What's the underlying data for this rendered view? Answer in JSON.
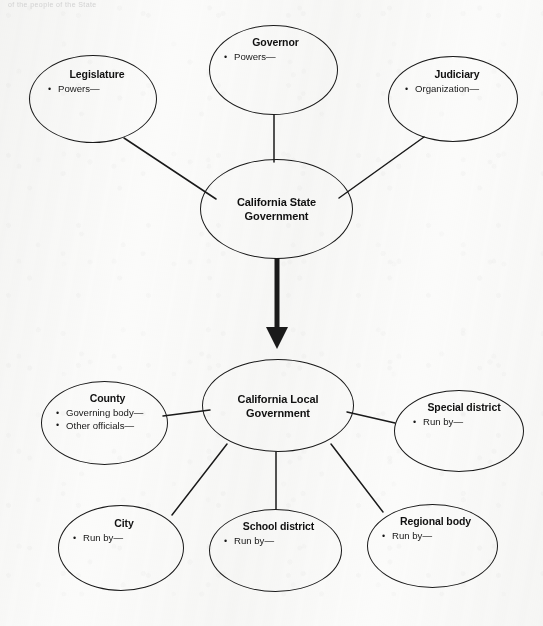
{
  "page": {
    "top_fragment": "of the people of the State",
    "background_color": "#fbfbfa",
    "ink_color": "#1a1a1a"
  },
  "diagram": {
    "type": "hierarchy-cluster",
    "hubs": [
      {
        "id": "state",
        "title": "California State Government"
      },
      {
        "id": "local",
        "title": "California Local Government"
      }
    ],
    "nodes": [
      {
        "id": "legislature",
        "title": "Legislature",
        "bullets": [
          "Powers—"
        ]
      },
      {
        "id": "governor",
        "title": "Governor",
        "bullets": [
          "Powers—"
        ]
      },
      {
        "id": "judiciary",
        "title": "Judiciary",
        "bullets": [
          "Organization—"
        ]
      },
      {
        "id": "county",
        "title": "County",
        "bullets": [
          "Governing body—",
          "Other officials—"
        ]
      },
      {
        "id": "special-district",
        "title": "Special district",
        "bullets": [
          "Run by—"
        ]
      },
      {
        "id": "city",
        "title": "City",
        "bullets": [
          "Run by—"
        ]
      },
      {
        "id": "school-district",
        "title": "School district",
        "bullets": [
          "Run by—"
        ]
      },
      {
        "id": "regional-body",
        "title": "Regional body",
        "bullets": [
          "Run by—"
        ]
      }
    ],
    "connections": [
      {
        "from": "legislature",
        "to": "state",
        "style": "line"
      },
      {
        "from": "governor",
        "to": "state",
        "style": "line"
      },
      {
        "from": "judiciary",
        "to": "state",
        "style": "line"
      },
      {
        "from": "state",
        "to": "local",
        "style": "thick-arrow-down"
      },
      {
        "from": "county",
        "to": "local",
        "style": "line"
      },
      {
        "from": "special-district",
        "to": "local",
        "style": "line"
      },
      {
        "from": "city",
        "to": "local",
        "style": "line"
      },
      {
        "from": "school-district",
        "to": "local",
        "style": "line"
      },
      {
        "from": "regional-body",
        "to": "local",
        "style": "line"
      }
    ]
  }
}
